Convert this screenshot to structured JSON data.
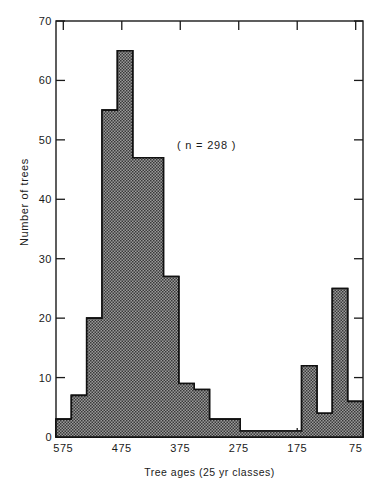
{
  "chart_data": {
    "type": "bar",
    "title": "",
    "subtitle": "",
    "xlabel": "Tree ages  (25 yr classes)",
    "ylabel": "Number of trees",
    "annotation": "( n = 298 )",
    "grid": false,
    "legend": "none",
    "xlim": [
      587.5,
      62.5
    ],
    "ylim": [
      0,
      70
    ],
    "x_reversed": true,
    "xtick_labels": [
      "575",
      "475",
      "375",
      "275",
      "175",
      "75"
    ],
    "xtick_values": [
      575,
      475,
      375,
      275,
      175,
      75
    ],
    "ytick_labels": [
      "0",
      "10",
      "20",
      "30",
      "40",
      "50",
      "60",
      "70"
    ],
    "ytick_values": [
      0,
      10,
      20,
      30,
      40,
      50,
      60,
      70
    ],
    "bin_width": 25,
    "bin_centers": [
      562,
      537,
      512,
      487,
      462,
      437,
      412,
      387,
      362,
      337,
      312,
      287,
      262,
      237,
      212,
      187,
      162,
      137,
      112,
      87
    ],
    "categories": [
      "575-550",
      "550-525",
      "525-500",
      "500-475",
      "475-450",
      "450-425",
      "425-400",
      "400-375",
      "375-350",
      "350-325",
      "325-300",
      "300-275",
      "275-250",
      "250-225",
      "225-200",
      "200-175",
      "175-150",
      "150-125",
      "125-100",
      "100-75"
    ],
    "values": [
      3,
      7,
      20,
      55,
      65,
      47,
      47,
      27,
      9,
      8,
      3,
      3,
      1,
      1,
      1,
      1,
      12,
      4,
      25,
      6
    ],
    "total": 298,
    "bar_fill_color": "#8a8a8a",
    "bar_edge_color": "#111111",
    "axis_color": "#1a1a1a",
    "background_color": "#ffffff"
  },
  "axes": {
    "plot_left_px": 56,
    "plot_right_px": 363,
    "plot_top_px": 21,
    "plot_bottom_px": 437
  }
}
